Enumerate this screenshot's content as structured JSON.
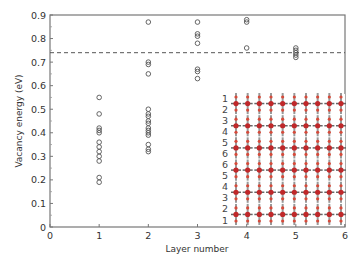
{
  "chart_data": {
    "type": "scatter",
    "title": "",
    "xlabel": "Layer number",
    "ylabel": "Vacancy energy (eV)",
    "xlim": [
      0,
      6
    ],
    "ylim": [
      0,
      0.9
    ],
    "xticks": [
      0,
      1,
      2,
      3,
      4,
      5,
      6
    ],
    "yticks": [
      0,
      0.1,
      0.2,
      0.3,
      0.4,
      0.5,
      0.6,
      0.7,
      0.8,
      0.9
    ],
    "ytick_labels": [
      "0",
      "0.1",
      "0.2",
      "0.3",
      "0.4",
      "0.5",
      "0.6",
      "0.7",
      "0.8",
      "0.9"
    ],
    "grid": false,
    "marker": "open-circle",
    "series": [
      {
        "name": "Layer 1",
        "x": 1,
        "values": [
          0.55,
          0.48,
          0.42,
          0.41,
          0.4,
          0.36,
          0.34,
          0.32,
          0.3,
          0.28,
          0.21,
          0.19
        ]
      },
      {
        "name": "Layer 2",
        "x": 2,
        "values": [
          0.87,
          0.7,
          0.69,
          0.65,
          0.5,
          0.48,
          0.47,
          0.45,
          0.44,
          0.42,
          0.41,
          0.4,
          0.39,
          0.35,
          0.33,
          0.32
        ]
      },
      {
        "name": "Layer 3",
        "x": 3,
        "values": [
          0.87,
          0.82,
          0.81,
          0.78,
          0.67,
          0.66,
          0.63
        ]
      },
      {
        "name": "Layer 4",
        "x": 4,
        "values": [
          0.88,
          0.87,
          0.76
        ]
      },
      {
        "name": "Layer 5",
        "x": 5,
        "values": [
          0.76,
          0.75,
          0.74,
          0.73,
          0.72
        ]
      }
    ],
    "reference_line": {
      "y": 0.74,
      "style": "dashed",
      "label": ""
    },
    "inset": {
      "description": "Atomic structure side view of a 12-layer slab (6 bilayers) with red-coloured atoms",
      "row_labels": [
        "1",
        "2",
        "3",
        "4",
        "5",
        "6",
        "6",
        "5",
        "4",
        "3",
        "2",
        "1"
      ]
    }
  }
}
